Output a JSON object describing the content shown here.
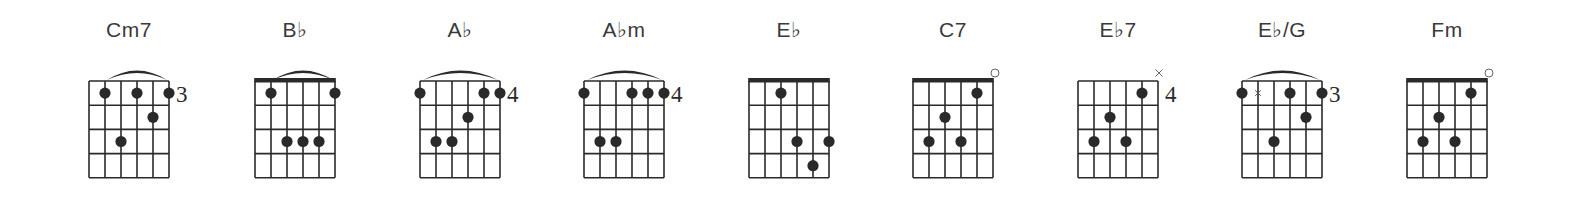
{
  "layout": {
    "grid_top": 81,
    "grid_width": 80,
    "fret_height": 24.2,
    "frets": 4,
    "strings": 6
  },
  "chords": [
    {
      "name": "Cm7",
      "grid_left": 89,
      "nut": false,
      "fret_marker": "3",
      "barre": [
        2,
        6
      ],
      "open": [],
      "muted": [],
      "muted_in_grid": [],
      "dots": [
        [
          1,
          2
        ],
        [
          1,
          4
        ],
        [
          1,
          6
        ],
        [
          2,
          5
        ],
        [
          3,
          3
        ]
      ]
    },
    {
      "name": "B♭",
      "grid_left": 255,
      "nut": true,
      "fret_marker": "",
      "barre": [
        2,
        6
      ],
      "open": [],
      "muted": [],
      "muted_in_grid": [],
      "dots": [
        [
          1,
          2
        ],
        [
          1,
          6
        ],
        [
          3,
          3
        ],
        [
          3,
          4
        ],
        [
          3,
          5
        ]
      ]
    },
    {
      "name": "A♭",
      "grid_left": 420,
      "nut": false,
      "fret_marker": "4",
      "barre": [
        1,
        6
      ],
      "open": [],
      "muted": [],
      "muted_in_grid": [],
      "dots": [
        [
          1,
          1
        ],
        [
          1,
          5
        ],
        [
          1,
          6
        ],
        [
          2,
          4
        ],
        [
          3,
          2
        ],
        [
          3,
          3
        ]
      ]
    },
    {
      "name": "A♭m",
      "grid_left": 584,
      "nut": false,
      "fret_marker": "4",
      "barre": [
        1,
        6
      ],
      "open": [],
      "muted": [],
      "muted_in_grid": [],
      "dots": [
        [
          1,
          1
        ],
        [
          1,
          4
        ],
        [
          1,
          5
        ],
        [
          1,
          6
        ],
        [
          3,
          2
        ],
        [
          3,
          3
        ]
      ]
    },
    {
      "name": "E♭",
      "grid_left": 749,
      "nut": true,
      "fret_marker": "",
      "barre": null,
      "open": [],
      "muted": [],
      "muted_in_grid": [],
      "dots": [
        [
          1,
          3
        ],
        [
          3,
          4
        ],
        [
          3,
          6
        ],
        [
          4,
          5
        ]
      ]
    },
    {
      "name": "C7",
      "grid_left": 913,
      "nut": true,
      "fret_marker": "",
      "barre": null,
      "open": [
        6
      ],
      "muted": [],
      "muted_in_grid": [],
      "dots": [
        [
          1,
          5
        ],
        [
          2,
          3
        ],
        [
          3,
          2
        ],
        [
          3,
          4
        ]
      ]
    },
    {
      "name": "E♭7",
      "grid_left": 1078,
      "nut": false,
      "fret_marker": "4",
      "barre": null,
      "open": [],
      "muted": [
        6
      ],
      "muted_in_grid": [],
      "dots": [
        [
          1,
          5
        ],
        [
          2,
          3
        ],
        [
          3,
          2
        ],
        [
          3,
          4
        ]
      ]
    },
    {
      "name": "E♭/G",
      "grid_left": 1242,
      "nut": false,
      "fret_marker": "3",
      "barre": [
        1,
        6
      ],
      "open": [],
      "muted": [],
      "muted_in_grid": [
        [
          1,
          2
        ]
      ],
      "dots": [
        [
          1,
          1
        ],
        [
          1,
          4
        ],
        [
          1,
          6
        ],
        [
          2,
          5
        ],
        [
          3,
          3
        ]
      ]
    },
    {
      "name": "Fm",
      "grid_left": 1407,
      "nut": true,
      "fret_marker": "",
      "barre": null,
      "open": [
        6
      ],
      "muted": [],
      "muted_in_grid": [],
      "dots": [
        [
          1,
          5
        ],
        [
          2,
          3
        ],
        [
          3,
          2
        ],
        [
          3,
          4
        ]
      ]
    }
  ],
  "colors": {
    "ink": "#2a2a2a",
    "label": "#3a3a3a",
    "background": "#ffffff"
  }
}
